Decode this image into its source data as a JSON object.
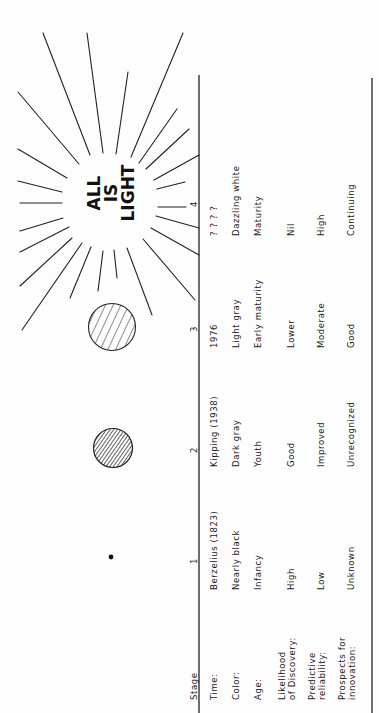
{
  "figure": {
    "banner": [
      "ALL",
      "IS",
      "LIGHT"
    ],
    "stage_header": "Stage",
    "stages": [
      "1",
      "2",
      "3",
      "4"
    ],
    "row_labels": [
      "Time:",
      "Color:",
      "Age:",
      "Likelihood\nof Discovery:",
      "Predictive\nreliability:",
      "Prospects for\ninnovation:"
    ],
    "row_labels_lines": [
      [
        "Time:"
      ],
      [
        "Color:"
      ],
      [
        "Age:"
      ],
      [
        "Likelihood",
        "of Discovery:"
      ],
      [
        "Predictive",
        "reliability:"
      ],
      [
        "Prospects for",
        "innovation:"
      ]
    ],
    "columns": [
      {
        "stage": "1",
        "symbol": "small-black-dot",
        "time": "Berzelius (1823)",
        "color": "Nearly black",
        "age": "Infancy",
        "likelihood": "High",
        "reliability": "Low",
        "prospects": "Unknown"
      },
      {
        "stage": "2",
        "symbol": "densely-hatched-circle",
        "time": "Kipping (1938)",
        "color": "Dark gray",
        "age": "Youth",
        "likelihood": "Good",
        "reliability": "Improved",
        "prospects": "Unrecognized"
      },
      {
        "stage": "3",
        "symbol": "sparsely-hatched-circle",
        "time": "1976",
        "color": "Light gray",
        "age": "Early maturity",
        "likelihood": "Lower",
        "reliability": "Moderate",
        "prospects": "Good"
      },
      {
        "stage": "4",
        "symbol": "radiant-sun",
        "time": "? ? ? ?",
        "color": "Dazzling white",
        "age": "Maturity",
        "likelihood": "Nil",
        "reliability": "High",
        "prospects": "Continuing"
      }
    ]
  }
}
